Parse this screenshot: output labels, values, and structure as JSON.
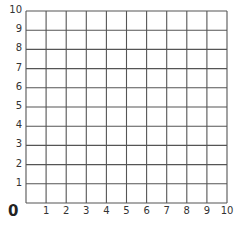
{
  "diagram": {
    "type": "coordinate-grid",
    "origin_label": "0",
    "x_axis": {
      "min": 0,
      "max": 10,
      "step": 1,
      "tick_labels": [
        "1",
        "2",
        "3",
        "4",
        "5",
        "6",
        "7",
        "8",
        "9",
        "10"
      ]
    },
    "y_axis": {
      "min": 0,
      "max": 10,
      "step": 1,
      "tick_labels": [
        "1",
        "2",
        "3",
        "4",
        "5",
        "6",
        "7",
        "8",
        "9",
        "10"
      ]
    },
    "grid_color": "#555555",
    "label_color": "#333333"
  }
}
